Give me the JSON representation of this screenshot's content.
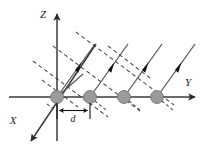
{
  "figure": {
    "width": 205,
    "height": 151,
    "background_color": "#ffffff"
  },
  "axes": {
    "z": {
      "label": "Z",
      "label_x": 43,
      "label_y": 18,
      "x1": 57,
      "y1": 140,
      "x2": 57,
      "y2": 12,
      "color": "#3a3a3a"
    },
    "y": {
      "label": "Y",
      "label_x": 188,
      "label_y": 86,
      "x1": 10,
      "y1": 97,
      "x2": 197,
      "y2": 97,
      "color": "#3a3a3a"
    },
    "x": {
      "label": "X",
      "label_x": 12,
      "label_y": 122,
      "x1": 96,
      "y1": 54,
      "x2": 29,
      "y2": 143,
      "color": "#3a3a3a"
    }
  },
  "scatterers": {
    "radius": 6.5,
    "fill_color": "#9a9a9a",
    "stroke_color": "#6f6f6f",
    "center_y": 97,
    "centers_x": [
      57,
      90,
      124,
      157
    ]
  },
  "dimension": {
    "label": "d",
    "label_x": 72,
    "label_y": 121,
    "line_y": 110,
    "x_start": 57,
    "x_end": 90,
    "tick_top": 103,
    "tick_bottom": 119,
    "color": "#1a1a1a"
  },
  "rays": {
    "description": "incident solid rays with arrowheads pointing down-left toward the scatterers",
    "color": "#555555",
    "count": 4,
    "arrow_color": "#111111",
    "segments": [
      {
        "x1": 57,
        "y1": 97,
        "x2": 93,
        "y2": 47,
        "arrow_at": 0.52
      },
      {
        "x1": 90,
        "y1": 97,
        "x2": 126,
        "y2": 47,
        "arrow_at": 0.52
      },
      {
        "x1": 124,
        "y1": 97,
        "x2": 160,
        "y2": 47,
        "arrow_at": 0.52
      },
      {
        "x1": 157,
        "y1": 97,
        "x2": 193,
        "y2": 47,
        "arrow_at": 0.52
      }
    ],
    "short_ray": {
      "x1": 57,
      "y1": 97,
      "x2": 82,
      "y2": 75
    }
  },
  "wavefronts": {
    "description": "dashed lines perpendicular to the rays representing wavefronts",
    "color": "#4a4a4a",
    "dash_pattern": "4 3",
    "count": 5
  },
  "colors": {
    "line": "#3a3a3a",
    "ray": "#555555",
    "dash": "#4a4a4a",
    "sphere_fill": "#9a9a9a",
    "sphere_stroke": "#6f6f6f",
    "text": "#1a1a1a"
  }
}
